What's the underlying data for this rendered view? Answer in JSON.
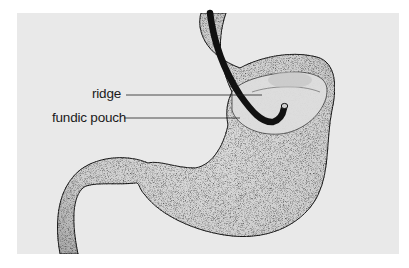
{
  "figure": {
    "background_color": "#e9e9e9",
    "organ_fill": "#d6d6d6",
    "endoscope_color": "#111111"
  },
  "labels": [
    {
      "id": "ridge",
      "text": "ridge"
    },
    {
      "id": "fundic_pouch",
      "text": "fundic pouch"
    }
  ]
}
